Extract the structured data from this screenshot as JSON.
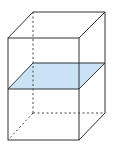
{
  "diagram": {
    "type": "rectangular-prism-with-cross-section",
    "colors": {
      "edge": "#333333",
      "plane_fill": "#c9e3f5",
      "background": "#ffffff"
    },
    "vertices": {
      "front_top_left": [
        8,
        38
      ],
      "front_top_right": [
        79,
        38
      ],
      "front_bottom_left": [
        8,
        140
      ],
      "front_bottom_right": [
        79,
        140
      ],
      "back_top_left": [
        33,
        12
      ],
      "back_top_right": [
        105,
        12
      ],
      "back_bottom_left": [
        33,
        113
      ],
      "back_bottom_right": [
        105,
        113
      ]
    },
    "cross_section": {
      "front_left": [
        8,
        89
      ],
      "front_right": [
        79,
        89
      ],
      "back_right": [
        105,
        63
      ],
      "back_left": [
        33,
        63
      ]
    }
  }
}
